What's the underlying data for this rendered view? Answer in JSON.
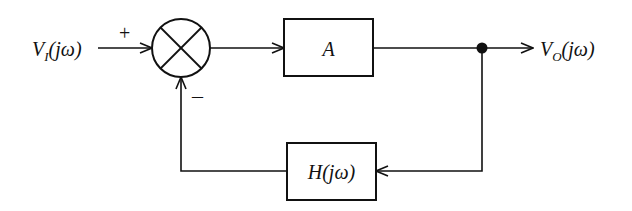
{
  "diagram": {
    "type": "block-diagram",
    "input": {
      "label_main": "V",
      "label_sub": "I",
      "label_rest": "(jω)"
    },
    "output": {
      "label_main": "V",
      "label_sub": "O",
      "label_rest": "(jω)"
    },
    "summing_junction": {
      "plus_sign": "+",
      "minus_sign": "–"
    },
    "forward_block": {
      "label": "A"
    },
    "feedback_block": {
      "label": "H(jω)"
    },
    "colors": {
      "stroke": "#111111",
      "background": "#ffffff"
    }
  }
}
